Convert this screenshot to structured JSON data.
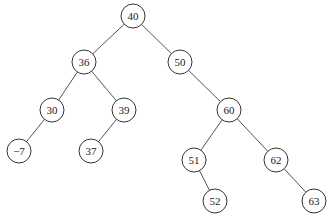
{
  "diagram": {
    "type": "binary-search-tree",
    "nodes": [
      {
        "id": "n40",
        "label": "40",
        "x": 133,
        "y": 16
      },
      {
        "id": "n36",
        "label": "36",
        "x": 84,
        "y": 62
      },
      {
        "id": "n50",
        "label": "50",
        "x": 180,
        "y": 62
      },
      {
        "id": "n30",
        "label": "30",
        "x": 52,
        "y": 110
      },
      {
        "id": "n39",
        "label": "39",
        "x": 124,
        "y": 110
      },
      {
        "id": "n60",
        "label": "60",
        "x": 229,
        "y": 110
      },
      {
        "id": "nm7",
        "label": "−7",
        "x": 19,
        "y": 151
      },
      {
        "id": "n37",
        "label": "37",
        "x": 91,
        "y": 151
      },
      {
        "id": "n51",
        "label": "51",
        "x": 194,
        "y": 160
      },
      {
        "id": "n62",
        "label": "62",
        "x": 276,
        "y": 160
      },
      {
        "id": "n52",
        "label": "52",
        "x": 215,
        "y": 201
      },
      {
        "id": "n63",
        "label": "63",
        "x": 314,
        "y": 201
      }
    ],
    "edges": [
      [
        "n40",
        "n36"
      ],
      [
        "n40",
        "n50"
      ],
      [
        "n36",
        "n30"
      ],
      [
        "n36",
        "n39"
      ],
      [
        "n50",
        "n60"
      ],
      [
        "n30",
        "nm7"
      ],
      [
        "n39",
        "n37"
      ],
      [
        "n60",
        "n51"
      ],
      [
        "n60",
        "n62"
      ],
      [
        "n51",
        "n52"
      ],
      [
        "n62",
        "n63"
      ]
    ],
    "radius": 12
  }
}
